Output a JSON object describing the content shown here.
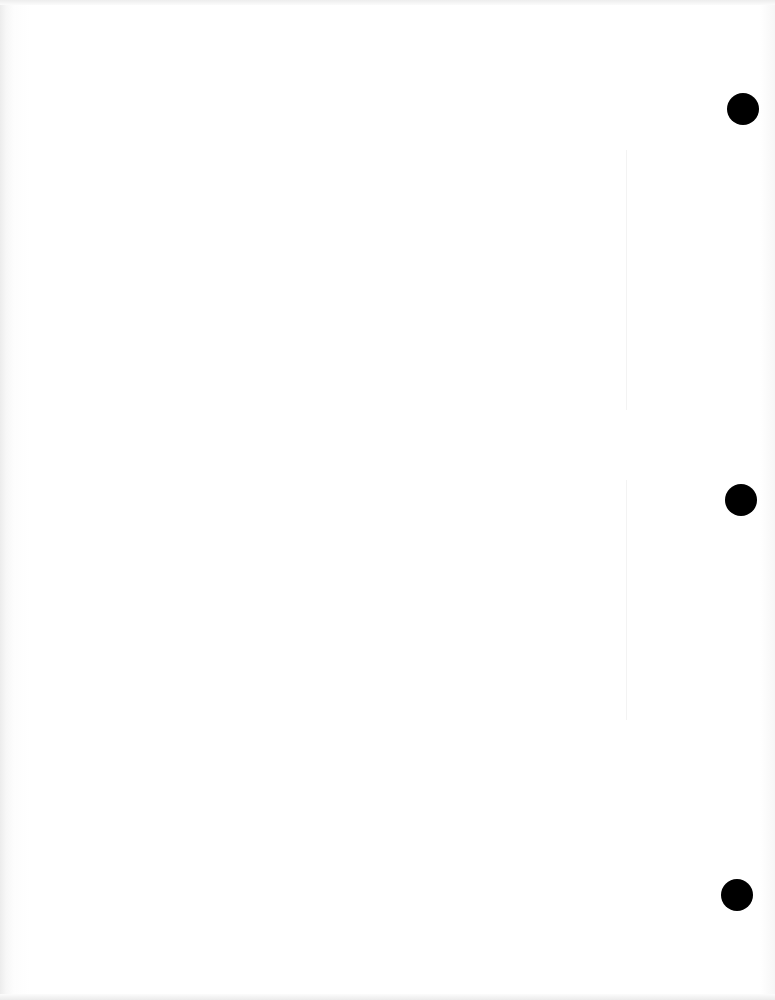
{
  "document": {
    "type": "blank-page",
    "text": "",
    "punch_holes": [
      {
        "name": "top",
        "cx": 743,
        "cy": 109,
        "r": 15
      },
      {
        "name": "middle",
        "cx": 741,
        "cy": 500,
        "r": 15
      },
      {
        "name": "bottom",
        "cx": 737,
        "cy": 895,
        "r": 15
      }
    ],
    "colors": {
      "paper": "#ffffff",
      "hole": "#000000"
    }
  }
}
